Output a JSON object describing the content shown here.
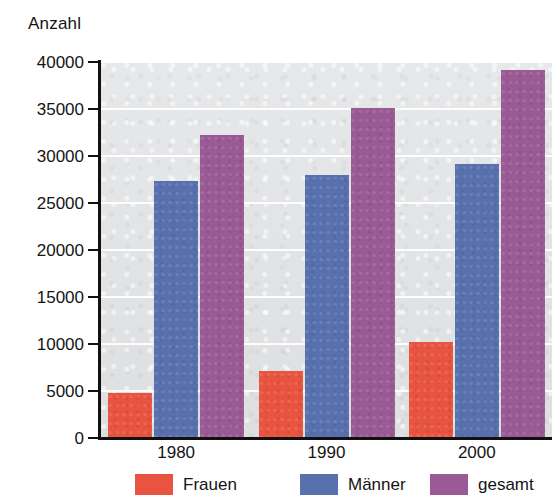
{
  "chart_data": {
    "type": "bar",
    "title": "",
    "ylabel": "Anzahl",
    "xlabel": "",
    "categories": [
      "1980",
      "1990",
      "2000"
    ],
    "series": [
      {
        "name": "Frauen",
        "color": "#e8543f",
        "values": [
          4800,
          7100,
          10200
        ]
      },
      {
        "name": "Männer",
        "color": "#5871ae",
        "values": [
          27300,
          28000,
          29100
        ]
      },
      {
        "name": "gesamt",
        "color": "#9a5a95",
        "values": [
          32200,
          35100,
          39200
        ]
      }
    ],
    "ylim": [
      0,
      40000
    ],
    "ytick_step": 5000,
    "yticks": [
      40000,
      35000,
      30000,
      25000,
      20000,
      15000,
      10000,
      5000,
      0
    ],
    "ytick_labels": [
      "40000",
      "35000",
      "30000",
      "25000",
      "20000",
      "15000",
      "10000",
      "5000",
      "0"
    ],
    "grid": "horizontal",
    "grid_color": "#ffffff",
    "plot_background": "#e2e3e5",
    "legend_position": "bottom",
    "legend": [
      "Frauen",
      "Männer",
      "gesamt"
    ]
  }
}
